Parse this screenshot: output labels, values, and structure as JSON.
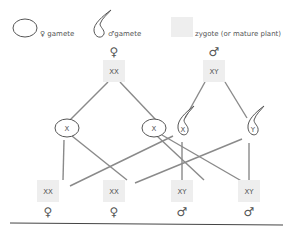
{
  "legend": {
    "female_gamete": "♀ gamete",
    "male_gamete": "♂gamete",
    "zygote": "zygote (or mature plant)"
  },
  "parents": [
    {
      "genotype": "XX",
      "sex_symbol": "♀"
    },
    {
      "genotype": "XY",
      "sex_symbol": "♂"
    }
  ],
  "gametes": [
    {
      "type": "female",
      "chromosome": "X"
    },
    {
      "type": "female",
      "chromosome": "X"
    },
    {
      "type": "male",
      "chromosome": "X"
    },
    {
      "type": "male",
      "chromosome": "Y"
    }
  ],
  "offspring": [
    {
      "genotype": "XX",
      "sex_symbol": "♀"
    },
    {
      "genotype": "XX",
      "sex_symbol": "♀"
    },
    {
      "genotype": "XY",
      "sex_symbol": "♂"
    },
    {
      "genotype": "XY",
      "sex_symbol": "♂"
    }
  ]
}
